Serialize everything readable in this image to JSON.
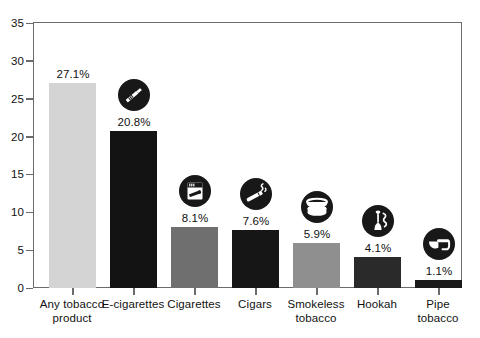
{
  "chart_data": {
    "type": "bar",
    "title": "",
    "subtitle": "",
    "xlabel": "",
    "ylabel": "",
    "ylim": [
      0,
      35
    ],
    "yticks": [
      0,
      5,
      10,
      15,
      20,
      25,
      30,
      35
    ],
    "ytick_labels": [
      "0",
      "5",
      "10",
      "15",
      "20",
      "25",
      "30",
      "35"
    ],
    "grid": false,
    "legend": "none",
    "categories": [
      "Any tobacco product",
      "E-cigarettes",
      "Cigarettes",
      "Cigars",
      "Smokeless tobacco",
      "Hookah",
      "Pipe tobacco"
    ],
    "values": [
      27.1,
      20.8,
      8.1,
      7.6,
      5.9,
      4.1,
      1.1
    ],
    "data_labels": [
      "27.1%",
      "20.8%",
      "8.1%",
      "7.6%",
      "5.9%",
      "4.1%",
      "1.1%"
    ],
    "bar_colors": [
      "#d4d4d4",
      "#131313",
      "#6f6f6f",
      "#161616",
      "#8f8f8f",
      "#2a2a2a",
      "#1a1a1a"
    ],
    "series": [
      {
        "name": "Percent of students",
        "values": [
          27.1,
          20.8,
          8.1,
          7.6,
          5.9,
          4.1,
          1.1
        ]
      }
    ]
  },
  "axis": {
    "y_ticks": [
      {
        "label": "35",
        "value": 35
      },
      {
        "label": "30",
        "value": 30
      },
      {
        "label": "25",
        "value": 25
      },
      {
        "label": "20",
        "value": 20
      },
      {
        "label": "15",
        "value": 15
      },
      {
        "label": "10",
        "value": 10
      },
      {
        "label": "5",
        "value": 5
      },
      {
        "label": "0",
        "value": 0
      }
    ]
  },
  "bars": [
    {
      "id": "any-tobacco-product",
      "label_line1": "Any tobacco",
      "label_line2": "product",
      "value_label": "27.1%",
      "value": 27.1,
      "color": "#d4d4d4",
      "icon": "none"
    },
    {
      "id": "e-cigarettes",
      "label_line1": "E-cigarettes",
      "label_line2": "",
      "value_label": "20.8%",
      "value": 20.8,
      "color": "#131313",
      "icon": "e-cigarette-icon"
    },
    {
      "id": "cigarettes",
      "label_line1": "Cigarettes",
      "label_line2": "",
      "value_label": "8.1%",
      "value": 8.1,
      "color": "#6f6f6f",
      "icon": "cigarette-pack-icon"
    },
    {
      "id": "cigars",
      "label_line1": "Cigars",
      "label_line2": "",
      "value_label": "7.6%",
      "value": 7.6,
      "color": "#161616",
      "icon": "cigar-icon"
    },
    {
      "id": "smokeless-tobacco",
      "label_line1": "Smokeless",
      "label_line2": "tobacco",
      "value_label": "5.9%",
      "value": 5.9,
      "color": "#8f8f8f",
      "icon": "smokeless-tin-icon"
    },
    {
      "id": "hookah",
      "label_line1": "Hookah",
      "label_line2": "",
      "value_label": "4.1%",
      "value": 4.1,
      "color": "#2a2a2a",
      "icon": "hookah-icon"
    },
    {
      "id": "pipe-tobacco",
      "label_line1": "Pipe",
      "label_line2": "tobacco",
      "value_label": "1.1%",
      "value": 1.1,
      "color": "#1a1a1a",
      "icon": "pipe-icon"
    }
  ],
  "colors": {
    "frame": "#6b6b6b",
    "text": "#111111",
    "background": "#ffffff",
    "icon_circle": "#181818",
    "icon_glyph": "#ffffff"
  }
}
